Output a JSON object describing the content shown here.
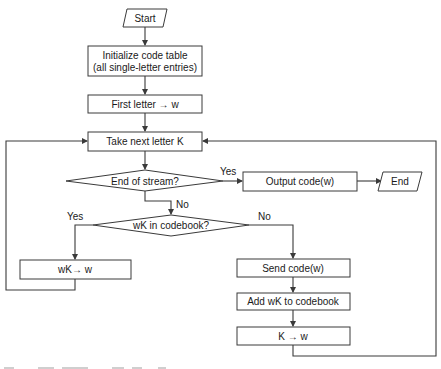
{
  "diagram": {
    "type": "flowchart",
    "nodes": {
      "start": {
        "shape": "parallelogram",
        "label": "Start"
      },
      "init": {
        "shape": "process",
        "lines": [
          "Initialize code table",
          "(all single-letter entries)"
        ]
      },
      "first_letter": {
        "shape": "process",
        "label": "First letter → w"
      },
      "take_next": {
        "shape": "process",
        "label": "Take next letter K"
      },
      "end_of_stream": {
        "shape": "decision",
        "label": "End of stream?"
      },
      "output_code": {
        "shape": "process",
        "label": "Output code(w)"
      },
      "end": {
        "shape": "parallelogram",
        "label": "End"
      },
      "in_codebook": {
        "shape": "decision",
        "label": "wK in codebook?"
      },
      "wk_to_w": {
        "shape": "process",
        "label": "wK→ w"
      },
      "send_code": {
        "shape": "process",
        "label": "Send code(w)"
      },
      "add_wk": {
        "shape": "process",
        "label": "Add wK to codebook"
      },
      "k_to_w": {
        "shape": "process",
        "label": "K → w"
      }
    },
    "edge_labels": {
      "end_of_stream_yes": "Yes",
      "end_of_stream_no": "No",
      "in_codebook_yes": "Yes",
      "in_codebook_no": "No"
    },
    "edges": [
      {
        "from": "start",
        "to": "init"
      },
      {
        "from": "init",
        "to": "first_letter"
      },
      {
        "from": "first_letter",
        "to": "take_next"
      },
      {
        "from": "take_next",
        "to": "end_of_stream"
      },
      {
        "from": "end_of_stream",
        "to": "output_code",
        "label": "Yes"
      },
      {
        "from": "output_code",
        "to": "end"
      },
      {
        "from": "end_of_stream",
        "to": "in_codebook",
        "label": "No"
      },
      {
        "from": "in_codebook",
        "to": "wk_to_w",
        "label": "Yes"
      },
      {
        "from": "in_codebook",
        "to": "send_code",
        "label": "No"
      },
      {
        "from": "wk_to_w",
        "to": "take_next"
      },
      {
        "from": "send_code",
        "to": "add_wk"
      },
      {
        "from": "add_wk",
        "to": "k_to_w"
      },
      {
        "from": "k_to_w",
        "to": "take_next"
      }
    ],
    "colors": {
      "line": "#3a3a3a",
      "text": "#1a1a1a",
      "fill": "#ffffff"
    }
  }
}
